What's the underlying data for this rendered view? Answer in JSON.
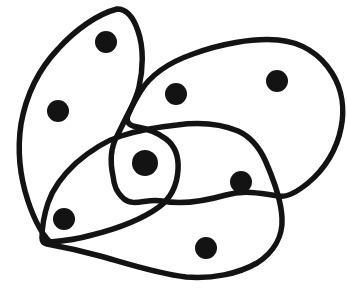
{
  "canvas": {
    "width": 347,
    "height": 300,
    "background": "#ffffff"
  },
  "style": {
    "stroke_color": "#131313",
    "stroke_width": 5.5,
    "dot_color": "#131313"
  },
  "curves": [
    {
      "name": "left-set-curve",
      "path": "M 117 9 C 98 14 76 29 58 49 C 39 69 26 96 21 124 C 17 151 20 177 28 201 C 34 219 41 233 50 242 C 63 241 78 239 92 235 C 116 229 141 220 159 207 C 171 198 177 186 178 170 C 179 156 175 146 166 139 C 157 132 144 128 133 126 C 128 124 126 121 128 115 C 133 104 137 96 139 87 C 143 70 144 48 138 31 C 134 19 127 9 117 9 Z"
    },
    {
      "name": "right-set-curve",
      "path": "M 113 176 C 110 162 111 147 117 136 C 123 124 131 107 140 92 C 151 74 170 62 193 54 C 220 44 252 38 278 40 C 301 42 320 54 332 73 C 342 89 345 109 341 128 C 337 149 325 169 308 183 C 297 192 287 198 278 196 C 260 193 243 190 226 195 C 205 201 183 205 162 201 C 147 198 134 207 124 199 C 116 192 114 185 113 176 Z"
    },
    {
      "name": "bottom-set-curve",
      "path": "M 42 238 C 42 227 44 215 48 203 C 53 188 62 176 76 163 C 90 151 105 141 121 136 C 139 130 158 127 177 125 C 199 122 221 124 238 131 C 251 137 259 147 265 160 C 273 178 281 198 282 218 C 283 236 274 252 257 263 C 238 274 212 279 186 277 C 158 274 128 264 100 256 C 78 250 58 246 47 244 C 43 243 42 241 42 238 Z"
    }
  ],
  "dots": [
    {
      "name": "dot-left-top",
      "region": "left",
      "cx": 106,
      "cy": 42,
      "r": 11
    },
    {
      "name": "dot-left-mid",
      "region": "left",
      "cx": 58,
      "cy": 111,
      "r": 11
    },
    {
      "name": "dot-right-inner",
      "region": "right",
      "cx": 176,
      "cy": 94,
      "r": 11
    },
    {
      "name": "dot-right-outer",
      "region": "right",
      "cx": 277,
      "cy": 81,
      "r": 11
    },
    {
      "name": "dot-center-triple",
      "region": "left-right-bottom",
      "cx": 145,
      "cy": 163,
      "r": 13
    },
    {
      "name": "dot-right-bottom",
      "region": "right-bottom",
      "cx": 241,
      "cy": 182,
      "r": 11
    },
    {
      "name": "dot-left-bottom",
      "region": "left-bottom",
      "cx": 64,
      "cy": 219,
      "r": 11
    },
    {
      "name": "dot-bottom-only",
      "region": "bottom",
      "cx": 206,
      "cy": 248,
      "r": 11
    }
  ]
}
